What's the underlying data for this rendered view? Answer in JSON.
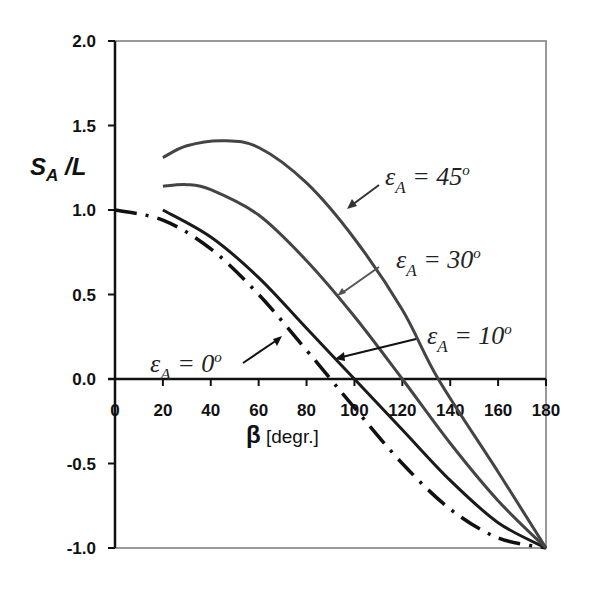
{
  "chart_data": {
    "type": "line",
    "title": "",
    "xlabel": "β [degr.]",
    "ylabel": "S_A /L",
    "xlim": [
      0,
      180
    ],
    "ylim": [
      -1.0,
      2.0
    ],
    "x_ticks": [
      "0",
      "20",
      "40",
      "60",
      "80",
      "100",
      "120",
      "140",
      "160",
      "180"
    ],
    "y_ticks": [
      "2.0",
      "1.5",
      "1.0",
      "0.5",
      "0.0",
      "-0.5",
      "-1.0"
    ],
    "grid": false,
    "legend": "annotations with arrows",
    "series": [
      {
        "name": "εA = 0°",
        "style": "dash-dot",
        "color": "#111111",
        "x": [
          0,
          20,
          40,
          60,
          80,
          90,
          100,
          120,
          140,
          160,
          180
        ],
        "y": [
          1.0,
          0.94,
          0.77,
          0.5,
          0.17,
          0.0,
          -0.17,
          -0.5,
          -0.77,
          -0.94,
          -1.0
        ]
      },
      {
        "name": "εA = 10°",
        "style": "solid",
        "color": "#1a1a1a",
        "x": [
          20,
          40,
          60,
          80,
          100,
          120,
          140,
          160,
          180
        ],
        "y": [
          1.0,
          0.84,
          0.6,
          0.3,
          0.0,
          -0.3,
          -0.6,
          -0.85,
          -1.0
        ]
      },
      {
        "name": "εA = 30°",
        "style": "solid",
        "color": "#444444",
        "x": [
          20,
          30,
          40,
          60,
          80,
          100,
          120,
          140,
          160,
          180
        ],
        "y": [
          1.14,
          1.15,
          1.12,
          0.97,
          0.7,
          0.37,
          0.0,
          -0.38,
          -0.72,
          -1.0
        ]
      },
      {
        "name": "εA = 45°",
        "style": "solid",
        "color": "#444444",
        "x": [
          20,
          30,
          45,
          60,
          80,
          100,
          120,
          135,
          160,
          180
        ],
        "y": [
          1.31,
          1.38,
          1.41,
          1.37,
          1.16,
          0.83,
          0.41,
          0.0,
          -0.55,
          -1.0
        ]
      }
    ],
    "annotations": [
      {
        "text": "εA = 45°",
        "main": "ε",
        "sub": "A",
        "rest": " = 45",
        "sup": "o"
      },
      {
        "text": "εA = 30°",
        "main": "ε",
        "sub": "A",
        "rest": " = 30",
        "sup": "o"
      },
      {
        "text": "εA = 10°",
        "main": "ε",
        "sub": "A",
        "rest": " = 10",
        "sup": "o"
      },
      {
        "text": "εA = 0°",
        "main": "ε",
        "sub": "A",
        "rest": " = 0",
        "sup": "o"
      }
    ]
  },
  "axis": {
    "y_label_main": "S",
    "y_label_sub": "A",
    "y_label_rest": " /L",
    "x_label_beta": "β",
    "x_label_unit": " [degr.]"
  }
}
